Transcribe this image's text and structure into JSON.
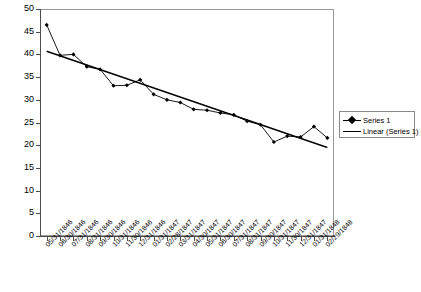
{
  "chart_data": {
    "type": "line",
    "title": "",
    "subtitle": "",
    "xlabel": "",
    "ylabel": "",
    "ylim": [
      0,
      50
    ],
    "ytick_step": 5,
    "yticks": [
      0,
      5,
      10,
      15,
      20,
      25,
      30,
      35,
      40,
      45,
      50
    ],
    "grid": false,
    "legend_position": "right",
    "categories": [
      "05/31/1846",
      "06/30/1846",
      "07/31/1846",
      "08/31/1846",
      "09/30/1846",
      "10/31/1846",
      "11/30/1846",
      "12/31/1846",
      "01/31/1847",
      "02/28/1847",
      "03/31/1847",
      "04/30/1847",
      "05/31/1847",
      "06/30/1847",
      "07/31/1847",
      "08/31/1847",
      "09/30/1847",
      "10/31/1847",
      "11/30/1847",
      "12/31/1847",
      "01/31/1848",
      "02/29/1848"
    ],
    "series": [
      {
        "name": "Series 1",
        "type": "line-marker",
        "color": "#000000",
        "marker": "diamond",
        "values": [
          46.5,
          39.8,
          40.0,
          37.3,
          36.7,
          33.1,
          33.2,
          34.4,
          31.2,
          30.0,
          29.4,
          27.9,
          27.7,
          27.1,
          26.7,
          25.3,
          24.5,
          20.7,
          22.0,
          21.8,
          24.1,
          21.6
        ]
      },
      {
        "name": "Linear (Series 1)",
        "type": "trendline",
        "color": "#000000",
        "start_value": 40.7,
        "end_value": 19.5
      }
    ],
    "legend": [
      {
        "label": "Series 1",
        "key": "line-with-diamond-marker",
        "color": "#000000"
      },
      {
        "label": "Linear (Series 1)",
        "key": "plain-line",
        "color": "#000000"
      }
    ]
  },
  "colors": {
    "series_1": "#000000",
    "trendline": "#000000",
    "axis": "#4d4d4d",
    "frame": "#9a9a9a",
    "background": "#ffffff"
  }
}
